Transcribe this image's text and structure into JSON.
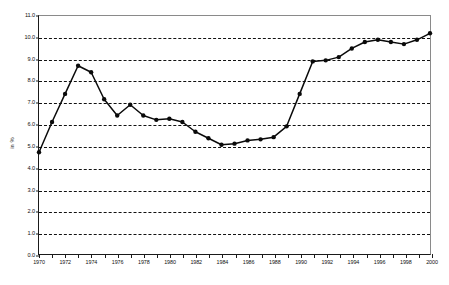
{
  "chart_data": {
    "type": "line",
    "title": "",
    "xlabel": "",
    "ylabel": "in %",
    "ylim": [
      0.0,
      11.0
    ],
    "xlim": [
      1970,
      2000
    ],
    "grid": true,
    "legend": false,
    "y_ticks": [
      "11.0",
      "10.0",
      "9.0",
      "8.0",
      "7.0",
      "6.0",
      "5.0",
      "4.0",
      "3.0",
      "2.0",
      "1.0",
      "0.0"
    ],
    "x_tick_labels": [
      "1970",
      "1972",
      "1974",
      "1976",
      "1978",
      "1980",
      "1982",
      "1984",
      "1986",
      "1988",
      "1990",
      "1992",
      "1994",
      "1996",
      "1998",
      "2000"
    ],
    "x": [
      1970,
      1971,
      1972,
      1973,
      1974,
      1975,
      1976,
      1977,
      1978,
      1979,
      1980,
      1981,
      1982,
      1983,
      1984,
      1985,
      1986,
      1987,
      1988,
      1989,
      1990,
      1991,
      1992,
      1993,
      1994,
      1995,
      1996,
      1997,
      1998,
      1999,
      2000
    ],
    "values": [
      4.7,
      6.1,
      7.4,
      8.7,
      8.4,
      7.15,
      6.4,
      6.9,
      6.4,
      6.2,
      6.25,
      6.1,
      5.65,
      5.35,
      5.05,
      5.1,
      5.25,
      5.3,
      5.4,
      5.9,
      7.4,
      8.9,
      8.95,
      9.1,
      9.5,
      9.8,
      9.9,
      9.8,
      9.7,
      9.9,
      10.2
    ],
    "series_color": "#0a0a0a",
    "marker": "filled-circle"
  }
}
